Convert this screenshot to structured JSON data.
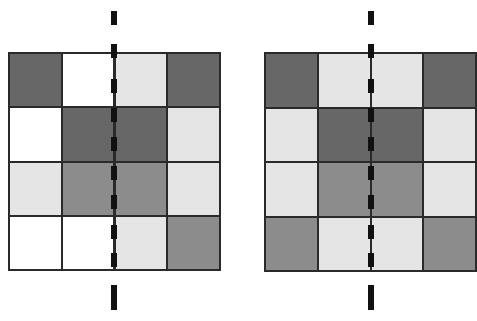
{
  "colors": {
    "dark": "#676767",
    "mid": "#8c8c8c",
    "light": "#e5e5e5",
    "white": "#ffffff",
    "grid_line": "#2a2a2a",
    "axis": "#111111"
  },
  "grids": [
    {
      "name": "asymmetric-grid",
      "rows": [
        [
          "dark",
          "white",
          "light",
          "dark"
        ],
        [
          "white",
          "dark",
          "dark",
          "light"
        ],
        [
          "light",
          "mid",
          "mid",
          "light"
        ],
        [
          "white",
          "white",
          "light",
          "mid"
        ]
      ]
    },
    {
      "name": "symmetric-grid",
      "rows": [
        [
          "dark",
          "light",
          "light",
          "dark"
        ],
        [
          "light",
          "dark",
          "dark",
          "light"
        ],
        [
          "light",
          "mid",
          "mid",
          "light"
        ],
        [
          "mid",
          "light",
          "light",
          "mid"
        ]
      ]
    }
  ],
  "axis": {
    "style": "dashed",
    "orientation": "vertical",
    "dash_count": 9
  }
}
